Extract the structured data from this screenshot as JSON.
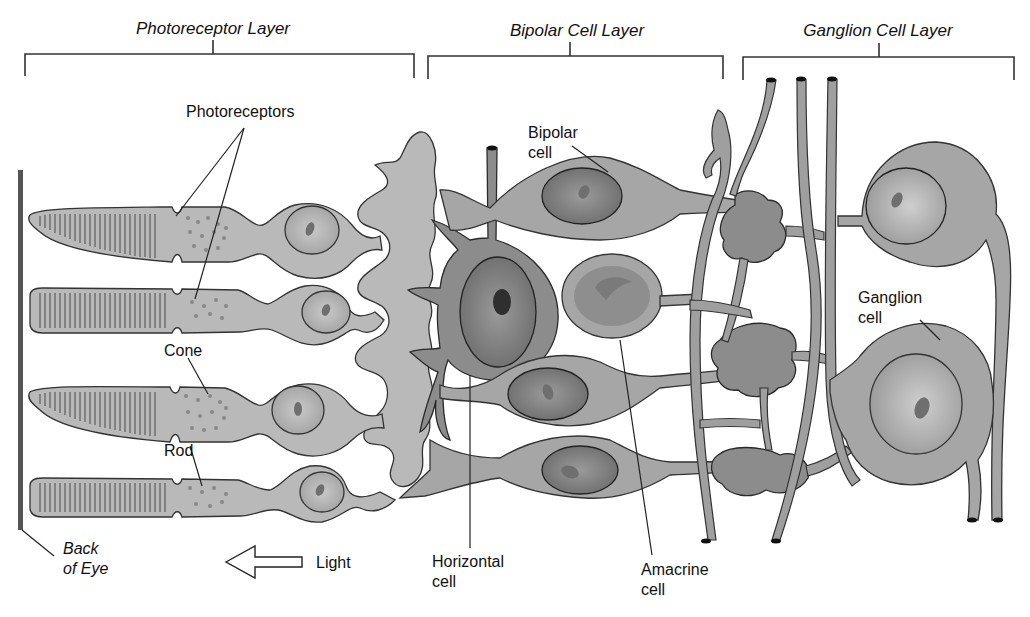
{
  "figure": {
    "type": "retina-cell-layers-diagram",
    "colors": {
      "background": "#ffffff",
      "photoreceptor_fill": "#b9b9b9",
      "bipolar_fill": "#a6a6a6",
      "horizontal_fill": "#8c8c8c",
      "amacrine_fill": "#8f8f8f",
      "ganglion_fill": "#a6a6a6",
      "outline": "#333333",
      "back_of_eye_bar": "#555555"
    }
  },
  "layers": [
    {
      "id": "photoreceptor",
      "label": "Photoreceptor Layer"
    },
    {
      "id": "bipolar",
      "label": "Bipolar Cell Layer"
    },
    {
      "id": "ganglion",
      "label": "Ganglion Cell Layer"
    }
  ],
  "labels": {
    "photoreceptors": "Photoreceptors",
    "cone": "Cone",
    "rod": "Rod",
    "back_of_eye_line1": "Back",
    "back_of_eye_line2": "of Eye",
    "light": "Light",
    "bipolar_line1": "Bipolar",
    "bipolar_line2": "cell",
    "horizontal_line1": "Horizontal",
    "horizontal_line2": "cell",
    "amacrine_line1": "Amacrine",
    "amacrine_line2": "cell",
    "ganglion_line1": "Ganglion",
    "ganglion_line2": "cell"
  },
  "arrow": {
    "direction": "left",
    "meaning": "light-direction"
  }
}
